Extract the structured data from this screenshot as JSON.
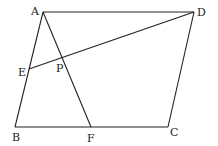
{
  "diagram": {
    "type": "geometry",
    "shape": "parallelogram ABCD",
    "points": {
      "A": {
        "label": "A",
        "x": 43,
        "y": 12
      },
      "D": {
        "label": "D",
        "x": 194,
        "y": 12
      },
      "C": {
        "label": "C",
        "x": 168,
        "y": 127
      },
      "B": {
        "label": "B",
        "x": 15,
        "y": 127
      },
      "E": {
        "label": "E",
        "x": 29,
        "y": 69
      },
      "F": {
        "label": "F",
        "x": 91,
        "y": 127
      },
      "P": {
        "label": "P",
        "x": 62,
        "y": 58
      }
    },
    "segments": [
      "AD",
      "DC",
      "CB",
      "BA",
      "AF",
      "ED"
    ],
    "line_color": "#222222"
  }
}
